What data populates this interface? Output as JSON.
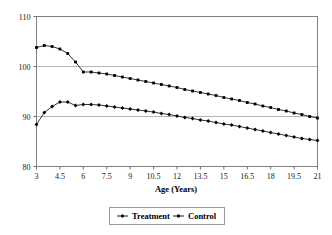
{
  "chart_data": {
    "type": "line",
    "title": "",
    "subtitle": "",
    "xlabel": "Age (Years)",
    "ylabel": "",
    "xlim": [
      3,
      21
    ],
    "ylim": [
      80,
      110
    ],
    "grid": "horizontal",
    "legend_position": "bottom",
    "x_tick_labels": [
      "3",
      "4.5",
      "6",
      "7.5",
      "9",
      "10.5",
      "12",
      "13.5",
      "15",
      "16.5",
      "18",
      "19.5",
      "21"
    ],
    "x_ticks": [
      3,
      4.5,
      6,
      7.5,
      9,
      10.5,
      12,
      13.5,
      15,
      16.5,
      18,
      19.5,
      21
    ],
    "y_tick_labels": [
      "80",
      "90",
      "100",
      "110"
    ],
    "y_ticks": [
      80,
      90,
      100,
      110
    ],
    "x": [
      3,
      3.5,
      4,
      4.5,
      5,
      5.5,
      6,
      6.5,
      7,
      7.5,
      8,
      8.5,
      9,
      9.5,
      10,
      10.5,
      11,
      11.5,
      12,
      12.5,
      13,
      13.5,
      14,
      14.5,
      15,
      15.5,
      16,
      16.5,
      17,
      17.5,
      18,
      18.5,
      19,
      19.5,
      20,
      20.5,
      21
    ],
    "series": [
      {
        "name": "Treatment",
        "marker": "diamond",
        "color": "#000000",
        "values": [
          88.4,
          90.8,
          92.0,
          92.9,
          92.9,
          92.2,
          92.4,
          92.4,
          92.3,
          92.1,
          91.9,
          91.7,
          91.5,
          91.3,
          91.1,
          90.9,
          90.6,
          90.4,
          90.1,
          89.8,
          89.6,
          89.3,
          89.1,
          88.8,
          88.5,
          88.3,
          88.0,
          87.7,
          87.4,
          87.1,
          86.8,
          86.5,
          86.2,
          85.9,
          85.6,
          85.4,
          85.2
        ]
      },
      {
        "name": "Control",
        "marker": "square",
        "color": "#000000",
        "values": [
          103.8,
          104.2,
          104.0,
          103.5,
          102.6,
          100.9,
          98.9,
          98.9,
          98.7,
          98.5,
          98.2,
          97.9,
          97.6,
          97.3,
          97.0,
          96.7,
          96.4,
          96.1,
          95.8,
          95.4,
          95.1,
          94.8,
          94.5,
          94.2,
          93.8,
          93.5,
          93.2,
          92.8,
          92.5,
          92.1,
          91.8,
          91.4,
          91.1,
          90.7,
          90.4,
          90.0,
          89.7
        ]
      }
    ]
  },
  "legend": {
    "items": [
      {
        "label": "Treatment"
      },
      {
        "label": "Control"
      }
    ]
  },
  "axis": {
    "x_title": "Age (Years)"
  }
}
